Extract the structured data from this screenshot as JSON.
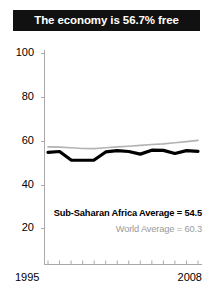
{
  "title": {
    "text": "The economy is 56.7% free"
  },
  "annotations": {
    "region_average": "Sub-Saharan Africa Average = 54.5",
    "world_average": "World Average = 60.3"
  },
  "colors": {
    "title_bar_background": "#111111",
    "title_text": "#ffffff",
    "region_line": "#000000",
    "world_line": "#b3b3b3",
    "axis": "#aaaaaa",
    "world_label_text": "#9a9a9a"
  },
  "chart_data": {
    "type": "line",
    "title": "The economy is 56.7% free",
    "xlabel": "",
    "ylabel": "",
    "xlim": [
      1995,
      2008
    ],
    "ylim": [
      0,
      100
    ],
    "yticks": [
      100,
      80,
      60,
      40,
      20
    ],
    "xticks": [
      1995,
      1996,
      1997,
      1998,
      1999,
      2000,
      2001,
      2002,
      2003,
      2004,
      2005,
      2006,
      2007,
      2008
    ],
    "xtick_labels_shown": [
      "1995",
      "2008"
    ],
    "grid": false,
    "legend": "none",
    "x": [
      1995,
      1996,
      1997,
      1998,
      1999,
      2000,
      2001,
      2002,
      2003,
      2004,
      2005,
      2006,
      2007,
      2008
    ],
    "series": [
      {
        "name": "Sub-Saharan Africa",
        "color": "#000000",
        "values": [
          54.8,
          55.2,
          51.3,
          51.2,
          51.3,
          55.0,
          55.6,
          55.2,
          54.0,
          55.8,
          55.7,
          54.3,
          55.6,
          55.3
        ]
      },
      {
        "name": "World Average",
        "color": "#b3b3b3",
        "values": [
          57.3,
          57.2,
          56.9,
          56.6,
          56.5,
          56.9,
          57.3,
          57.6,
          58.0,
          58.4,
          58.7,
          59.2,
          59.7,
          60.3
        ]
      }
    ],
    "annotations": [
      {
        "label": "Sub-Saharan Africa Average = 54.5",
        "value": 54.5
      },
      {
        "label": "World Average = 60.3",
        "value": 60.3
      }
    ]
  },
  "axis": {
    "yticks": [
      {
        "label": "100",
        "top": 47
      },
      {
        "label": "80",
        "top": 91
      },
      {
        "label": "60",
        "top": 135
      },
      {
        "label": "40",
        "top": 179
      },
      {
        "label": "20",
        "top": 222
      }
    ],
    "xticks": {
      "start": "1995",
      "end": "2008"
    }
  }
}
